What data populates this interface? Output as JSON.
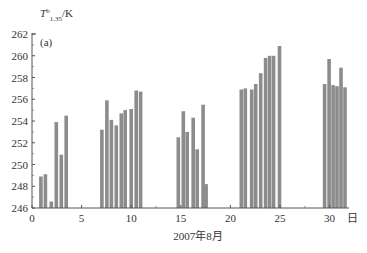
{
  "chart_data": {
    "type": "bar",
    "title": "",
    "panel_label": "(a)",
    "ylabel": "T^b_1.35/K",
    "ylabel_parts": {
      "base": "T",
      "sup": "b",
      "sub": "1.35",
      "unit": "/K"
    },
    "xlabel": "2007年8月",
    "x_unit_label": "日",
    "xlim": [
      0,
      32
    ],
    "ylim": [
      246,
      262
    ],
    "xticks": [
      0,
      5,
      10,
      15,
      20,
      25,
      30
    ],
    "yticks": [
      246,
      248,
      250,
      252,
      254,
      256,
      258,
      260,
      262
    ],
    "grid": false,
    "bar_color": "#8c8c8c",
    "series": [
      {
        "name": "Tb 1.35cm",
        "points": [
          {
            "x": 0.9,
            "y": 248.9
          },
          {
            "x": 1.35,
            "y": 249.1
          },
          {
            "x": 1.95,
            "y": 246.6
          },
          {
            "x": 2.45,
            "y": 253.9
          },
          {
            "x": 2.95,
            "y": 250.9
          },
          {
            "x": 3.45,
            "y": 254.5
          },
          {
            "x": 7.05,
            "y": 253.2
          },
          {
            "x": 7.55,
            "y": 255.9
          },
          {
            "x": 8.0,
            "y": 254.1
          },
          {
            "x": 8.5,
            "y": 253.6
          },
          {
            "x": 9.0,
            "y": 254.7
          },
          {
            "x": 9.4,
            "y": 255.0
          },
          {
            "x": 10.0,
            "y": 255.1
          },
          {
            "x": 10.5,
            "y": 256.8
          },
          {
            "x": 10.95,
            "y": 256.7
          },
          {
            "x": 14.75,
            "y": 252.5
          },
          {
            "x": 15.25,
            "y": 254.9
          },
          {
            "x": 15.65,
            "y": 253.0
          },
          {
            "x": 16.25,
            "y": 254.3
          },
          {
            "x": 16.65,
            "y": 251.4
          },
          {
            "x": 17.25,
            "y": 255.5
          },
          {
            "x": 17.55,
            "y": 248.2
          },
          {
            "x": 21.1,
            "y": 256.9
          },
          {
            "x": 21.5,
            "y": 257.0
          },
          {
            "x": 22.15,
            "y": 256.9
          },
          {
            "x": 22.55,
            "y": 257.4
          },
          {
            "x": 23.05,
            "y": 258.4
          },
          {
            "x": 23.55,
            "y": 259.8
          },
          {
            "x": 23.95,
            "y": 260.0
          },
          {
            "x": 24.35,
            "y": 260.0
          },
          {
            "x": 24.95,
            "y": 260.9
          },
          {
            "x": 29.5,
            "y": 257.4
          },
          {
            "x": 29.95,
            "y": 259.7
          },
          {
            "x": 30.35,
            "y": 257.3
          },
          {
            "x": 30.75,
            "y": 257.2
          },
          {
            "x": 31.15,
            "y": 258.9
          },
          {
            "x": 31.55,
            "y": 257.1
          }
        ]
      }
    ]
  }
}
